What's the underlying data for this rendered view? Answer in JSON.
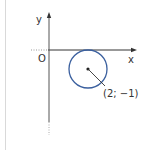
{
  "diagram": {
    "axes": {
      "x_label": "x",
      "y_label": "y",
      "origin_label": "O"
    },
    "circle": {
      "center_label": "(2; −1)",
      "center": [
        2,
        -1
      ],
      "radius": 1,
      "stroke_color": "#3a5f9e"
    },
    "colors": {
      "axis": "#333333",
      "border": "#d9d9d9",
      "dotted_extension": "#999999"
    }
  }
}
